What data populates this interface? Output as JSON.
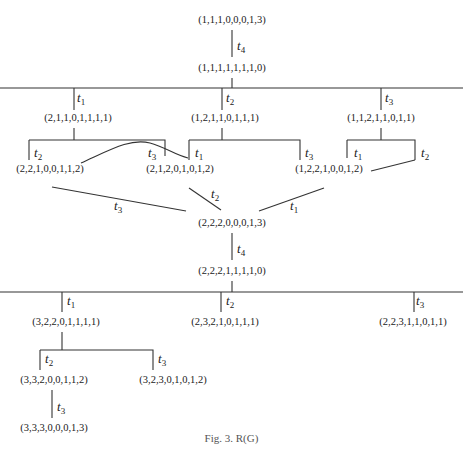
{
  "figure": {
    "caption": "Fig. 3. R(G)",
    "nodes": [
      {
        "id": "n0",
        "label": "(1,1,1,0,0,0,1,3)",
        "x": 232,
        "y": 23
      },
      {
        "id": "n1",
        "label": "(1,1,1,1,1,1,1,0)",
        "x": 232,
        "y": 71
      },
      {
        "id": "n2",
        "label": "(2,1,1,0,1,1,1,1)",
        "x": 78,
        "y": 121
      },
      {
        "id": "n3",
        "label": "(1,2,1,1,0,1,1,1)",
        "x": 225,
        "y": 121
      },
      {
        "id": "n4",
        "label": "(1,1,2,1,1,0,1,1)",
        "x": 381,
        "y": 121
      },
      {
        "id": "n5",
        "label": "(2,2,1,0,0,1,1,2)",
        "x": 50,
        "y": 172
      },
      {
        "id": "n6",
        "label": "(2,1,2,0,1,0,1,2)",
        "x": 180,
        "y": 172
      },
      {
        "id": "n7",
        "label": "(1,2,2,1,0,0,1,2)",
        "x": 329,
        "y": 172
      },
      {
        "id": "n8",
        "label": "(2,2,2,0,0,0,1,3)",
        "x": 232,
        "y": 226
      },
      {
        "id": "n9",
        "label": "(2,2,2,1,1,1,1,0)",
        "x": 232,
        "y": 274
      },
      {
        "id": "n10",
        "label": "(3,2,2,0,1,1,1,1)",
        "x": 66,
        "y": 325
      },
      {
        "id": "n11",
        "label": "(2,3,2,1,0,1,1,1)",
        "x": 225,
        "y": 325
      },
      {
        "id": "n12",
        "label": "(2,2,3,1,1,0,1,1)",
        "x": 413,
        "y": 325
      },
      {
        "id": "n13",
        "label": "(3,3,2,0,0,1,1,2)",
        "x": 54,
        "y": 383
      },
      {
        "id": "n14",
        "label": "(3,2,3,0,1,0,1,2)",
        "x": 173,
        "y": 383
      },
      {
        "id": "n15",
        "label": "(3,3,3,0,0,0,1,3)",
        "x": 54,
        "y": 431
      }
    ],
    "edge_labels": [
      {
        "t": "t",
        "sub": "4",
        "x": 237,
        "y": 50
      },
      {
        "t": "t",
        "sub": "1",
        "x": 77,
        "y": 102
      },
      {
        "t": "t",
        "sub": "2",
        "x": 226,
        "y": 102
      },
      {
        "t": "t",
        "sub": "3",
        "x": 385,
        "y": 102
      },
      {
        "t": "t",
        "sub": "2",
        "x": 34,
        "y": 157
      },
      {
        "t": "t",
        "sub": "3",
        "x": 148,
        "y": 157
      },
      {
        "t": "t",
        "sub": "1",
        "x": 195,
        "y": 157
      },
      {
        "t": "t",
        "sub": "3",
        "x": 305,
        "y": 157
      },
      {
        "t": "t",
        "sub": "1",
        "x": 354,
        "y": 157
      },
      {
        "t": "t",
        "sub": "2",
        "x": 421,
        "y": 157
      },
      {
        "t": "t",
        "sub": "3",
        "x": 114,
        "y": 210
      },
      {
        "t": "t",
        "sub": "2",
        "x": 211,
        "y": 198
      },
      {
        "t": "t",
        "sub": "1",
        "x": 290,
        "y": 210
      },
      {
        "t": "t",
        "sub": "4",
        "x": 237,
        "y": 253
      },
      {
        "t": "t",
        "sub": "1",
        "x": 67,
        "y": 305
      },
      {
        "t": "t",
        "sub": "2",
        "x": 226,
        "y": 305
      },
      {
        "t": "t",
        "sub": "3",
        "x": 416,
        "y": 305
      },
      {
        "t": "t",
        "sub": "2",
        "x": 45,
        "y": 363
      },
      {
        "t": "t",
        "sub": "3",
        "x": 158,
        "y": 363
      },
      {
        "t": "t",
        "sub": "3",
        "x": 57,
        "y": 411
      }
    ],
    "lines": [
      "M232,30 L232,57",
      "M232,78 L232,88",
      "M0,88 L463,88",
      "M74,88 L74,110",
      "M222,88 L222,110",
      "M381,88 L381,110",
      "M74,128 L74,140",
      "M29,140 L165,140 L165,156",
      "M29,140 L29,160",
      "M222,128 L222,140",
      "M189,140 L300,140 L300,160",
      "M189,140 L189,160",
      "M381,128 L381,140",
      "M347,140 L415,140 L415,160",
      "M347,140 L347,158",
      "M81,163 C110,150 130,138 150,143 C165,147 175,155 188,158",
      "M52,187 L186,211",
      "M189,188 L221,210",
      "M324,188 L259,211",
      "M371,171 L415,160",
      "M232,233 L232,260",
      "M232,281 L232,292",
      "M0,292 L463,292",
      "M62,292 L62,312",
      "M221,292 L221,312",
      "M414,292 L414,312",
      "M62,332 L62,350",
      "M40,350 L153,350 L153,370",
      "M40,350 L40,370",
      "M52,390 L52,418"
    ]
  }
}
